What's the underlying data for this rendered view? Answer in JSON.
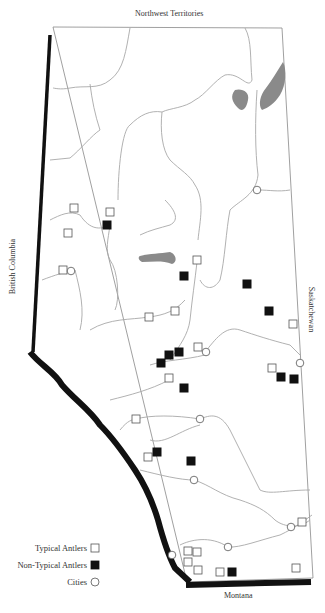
{
  "map": {
    "type": "map",
    "region": "Alberta",
    "neighbor_labels": {
      "north": "Northwest Territories",
      "west": "British Columbia",
      "east": "Saskatchewan",
      "south": "Montana"
    },
    "legend": [
      {
        "label": "Typical Antlers",
        "symbol": "open-square"
      },
      {
        "label": "Non-Typical Antlers",
        "symbol": "filled-square"
      },
      {
        "label": "Cities",
        "symbol": "open-circle"
      }
    ],
    "colors": {
      "border": "#888888",
      "thick_border": "#111111",
      "river": "#a8a8a8",
      "lake": "#8a8a8a",
      "marker": "#555555",
      "marker_fill": "#111111"
    },
    "typical_antlers": [
      [
        74,
        208
      ],
      [
        110,
        212
      ],
      [
        68,
        233
      ],
      [
        63,
        270
      ],
      [
        197,
        260
      ],
      [
        149,
        317
      ],
      [
        175,
        311
      ],
      [
        198,
        347
      ],
      [
        169,
        378
      ],
      [
        293,
        324
      ],
      [
        272,
        368
      ],
      [
        136,
        419
      ],
      [
        148,
        457
      ],
      [
        302,
        522
      ],
      [
        188,
        551
      ],
      [
        197,
        552
      ],
      [
        188,
        562
      ],
      [
        198,
        570
      ],
      [
        220,
        572
      ],
      [
        296,
        568
      ]
    ],
    "non_typical_antlers": [
      [
        107,
        225
      ],
      [
        184,
        276
      ],
      [
        247,
        284
      ],
      [
        269,
        311
      ],
      [
        179,
        352
      ],
      [
        169,
        355
      ],
      [
        161,
        363
      ],
      [
        184,
        388
      ],
      [
        281,
        377
      ],
      [
        294,
        379
      ],
      [
        157,
        452
      ],
      [
        191,
        461
      ],
      [
        232,
        572
      ]
    ],
    "cities": [
      [
        257,
        190
      ],
      [
        71,
        271
      ],
      [
        206,
        352
      ],
      [
        300,
        363
      ],
      [
        200,
        419
      ],
      [
        194,
        480
      ],
      [
        291,
        527
      ],
      [
        228,
        547
      ],
      [
        172,
        555
      ]
    ]
  }
}
